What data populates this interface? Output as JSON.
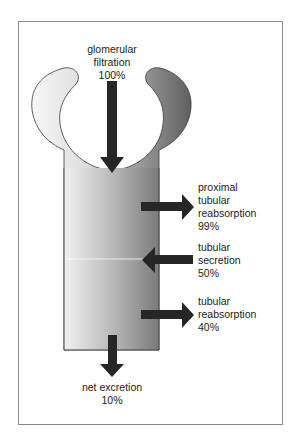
{
  "figure": {
    "type": "nephron-flow-diagram",
    "colors": {
      "frame": "#8a8a8a",
      "arrow": "#262626",
      "tubule_light": "#eeeeee",
      "tubule_dark": "#7e7e7e",
      "capsule_left": "#f2f2f2",
      "capsule_right": "#6e6e6e",
      "outline": "#3a3a3a"
    }
  },
  "labels": {
    "glomerular_filtration": {
      "line1": "glomerular",
      "line2": "filtration",
      "value": "100%"
    },
    "proximal_reabsorption": {
      "line1": "proximal",
      "line2": "tubular",
      "line3": "reabsorption",
      "value": "99%"
    },
    "tubular_secretion": {
      "line1": "tubular",
      "line2": "secretion",
      "value": "50%"
    },
    "tubular_reabsorption": {
      "line1": "tubular",
      "line2": "reabsorption",
      "value": "40%"
    },
    "net_excretion": {
      "line1": "net excretion",
      "value": "10%"
    }
  }
}
